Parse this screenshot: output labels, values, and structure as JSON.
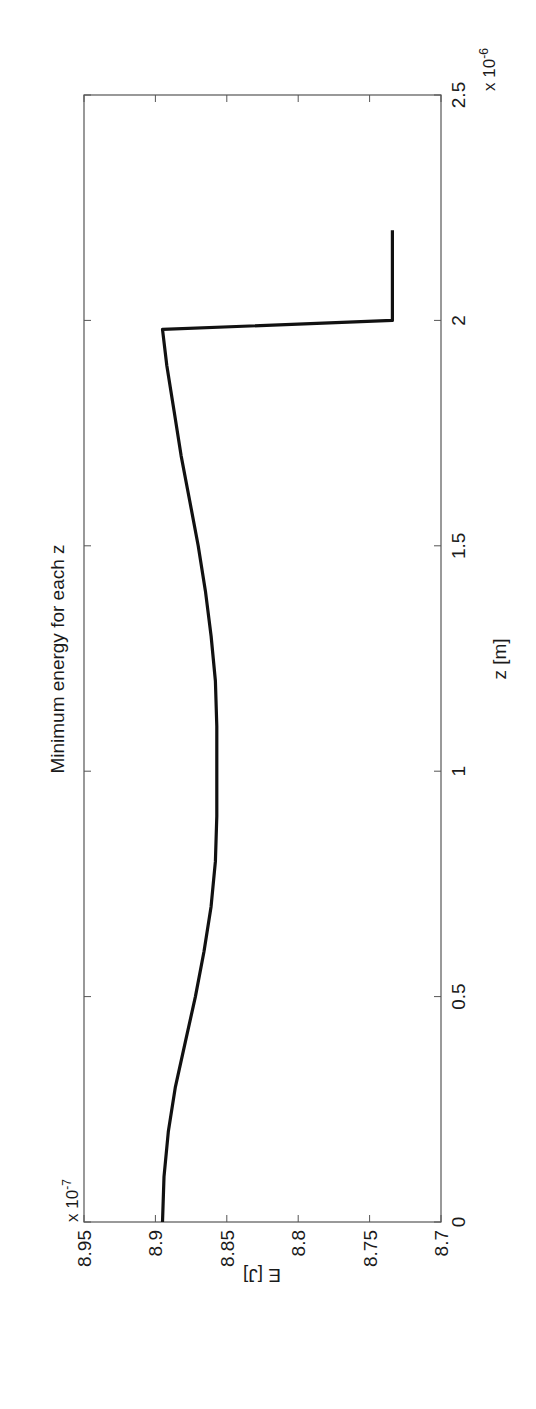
{
  "chart_data": {
    "type": "line",
    "orientation": "rotated 90 degrees counter-clockwise",
    "title": "Minimum energy for each z",
    "xlabel": "z [m]",
    "ylabel": "E [J]",
    "x_multiplier": "x 10^-6",
    "y_multiplier": "x 10^-7",
    "xlim": [
      0,
      2.5
    ],
    "ylim": [
      8.7,
      8.95
    ],
    "x_ticks": [
      "0",
      "0.5",
      "1",
      "1.5",
      "2",
      "2.5"
    ],
    "y_ticks": [
      "8.7",
      "8.75",
      "8.8",
      "8.85",
      "8.9",
      "8.95"
    ],
    "grid": false,
    "legend": null,
    "series": [
      {
        "name": "E_min(z)",
        "color": "#111111",
        "x": [
          0,
          0.1,
          0.2,
          0.3,
          0.4,
          0.5,
          0.6,
          0.7,
          0.8,
          0.9,
          1.0,
          1.1,
          1.2,
          1.3,
          1.4,
          1.5,
          1.6,
          1.7,
          1.8,
          1.9,
          1.98,
          2.0,
          2.2
        ],
        "y": [
          8.895,
          8.894,
          8.891,
          8.886,
          8.879,
          8.872,
          8.866,
          8.861,
          8.858,
          8.857,
          8.857,
          8.857,
          8.858,
          8.861,
          8.865,
          8.87,
          8.876,
          8.882,
          8.887,
          8.892,
          8.895,
          8.734,
          8.734
        ]
      }
    ]
  },
  "labels": {
    "title": "Minimum energy for each z",
    "xlabel": "z [m]",
    "ylabel": "E [J]",
    "x_exp_base": "x 10",
    "x_exp_power": "-6",
    "y_exp_base": "x 10",
    "y_exp_power": "-7",
    "x_ticks": [
      "0",
      "0.5",
      "1",
      "1.5",
      "2",
      "2.5"
    ],
    "y_ticks": [
      "8.7",
      "8.75",
      "8.8",
      "8.85",
      "8.9",
      "8.95"
    ]
  }
}
